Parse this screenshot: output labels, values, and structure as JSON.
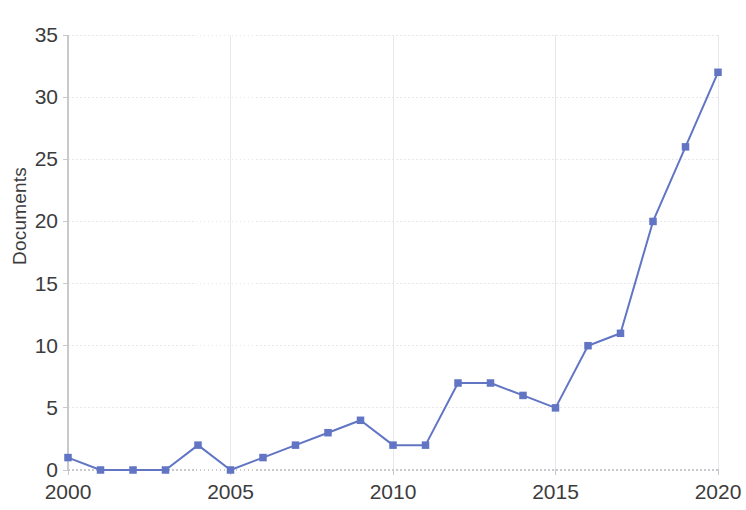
{
  "chart_data": {
    "type": "line",
    "title": "",
    "subtitle": "",
    "xlabel": "",
    "ylabel": "Documents",
    "x": [
      2000,
      2001,
      2002,
      2003,
      2004,
      2005,
      2006,
      2007,
      2008,
      2009,
      2010,
      2011,
      2012,
      2013,
      2014,
      2015,
      2016,
      2017,
      2018,
      2019,
      2020
    ],
    "values": [
      1,
      0,
      0,
      0,
      2,
      0,
      1,
      2,
      3,
      4,
      2,
      2,
      7,
      7,
      6,
      5,
      10,
      11,
      20,
      26,
      32
    ],
    "series": [
      {
        "name": "Documents",
        "values": [
          1,
          0,
          0,
          0,
          2,
          0,
          1,
          2,
          3,
          4,
          2,
          2,
          7,
          7,
          6,
          5,
          10,
          11,
          20,
          26,
          32
        ]
      }
    ],
    "xlim": [
      2000,
      2020
    ],
    "ylim": [
      0,
      35
    ],
    "x_ticks": [
      2000,
      2005,
      2010,
      2015,
      2020
    ],
    "x_tick_labels": [
      "2000",
      "2005",
      "2010",
      "2015",
      "2020"
    ],
    "y_ticks": [
      0,
      5,
      10,
      15,
      20,
      25,
      30,
      35
    ],
    "y_tick_labels": [
      "0",
      "5",
      "10",
      "15",
      "20",
      "25",
      "30",
      "35"
    ],
    "grid": true,
    "grid_axis": "both",
    "legend": false,
    "legend_position": "none",
    "marker": "square",
    "line_color": "#6175c4",
    "marker_color": "#6175c4",
    "grid_color": "#e8e8ea",
    "axis_color": "#c9c9cd",
    "text_color": "#3c3c3c",
    "background_color": "#ffffff"
  }
}
